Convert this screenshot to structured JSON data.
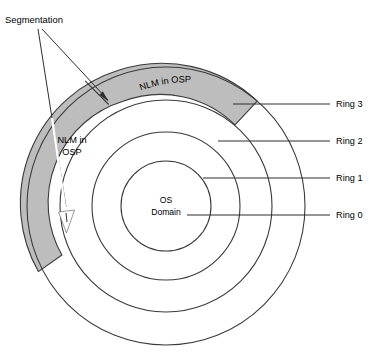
{
  "diagram": {
    "colors": {
      "wedge_gray": "#bdbdbd",
      "stroke": "#3a3a3a",
      "leader": "#2e2e2e",
      "background": "#ffffff",
      "arrow_white": "#ffffff"
    },
    "geometry": {
      "center_x": 166,
      "center_y": 206,
      "radii": [
        45,
        74,
        106,
        139
      ]
    },
    "center_label": {
      "line1": "OS",
      "line2": "Domain"
    },
    "ring_labels": [
      {
        "id": "ring-3",
        "text": "Ring 3",
        "x": 336,
        "y": 104,
        "leader_x1": 233,
        "leader_x2": 330,
        "leader_y": 104
      },
      {
        "id": "ring-2",
        "text": "Ring 2",
        "x": 336,
        "y": 141,
        "leader_x1": 218,
        "leader_x2": 330,
        "leader_y": 141
      },
      {
        "id": "ring-1",
        "text": "Ring 1",
        "x": 336,
        "y": 178,
        "leader_x1": 203,
        "leader_x2": 330,
        "leader_y": 178
      },
      {
        "id": "ring-0",
        "text": "Ring 0",
        "x": 336,
        "y": 215,
        "leader_x1": 187,
        "leader_x2": 330,
        "leader_y": 215
      }
    ],
    "segmentation": {
      "label": "Segmentation",
      "label_x": 5,
      "label_y": 23
    },
    "wedge_segments": [
      {
        "id": "nlm-osp-upper",
        "text": "NLM in OSP",
        "orientation": "curved"
      },
      {
        "id": "nlm-osp-lower",
        "line1": "NLM in",
        "line2": "OSP",
        "orientation": "horizontal"
      }
    ]
  }
}
